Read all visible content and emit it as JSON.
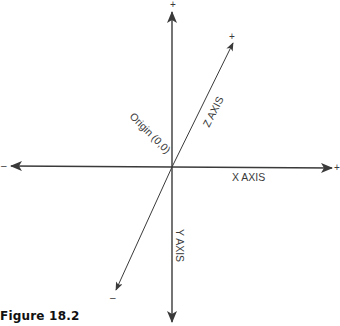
{
  "figure": {
    "caption": "Figure 18.2",
    "colors": {
      "axis": "#3a3a3a",
      "text": "#3a3a3a",
      "caption": "#111111",
      "background": "#ffffff"
    },
    "origin_label": "Origin (0,0)",
    "axes": {
      "x": {
        "label": "X AXIS",
        "positive_sign": "+",
        "negative_sign": "–"
      },
      "y": {
        "label": "Y AXIS",
        "positive_sign": "+"
      },
      "z": {
        "label": "Z AXIS",
        "positive_sign": "+",
        "negative_sign": "–"
      }
    }
  }
}
